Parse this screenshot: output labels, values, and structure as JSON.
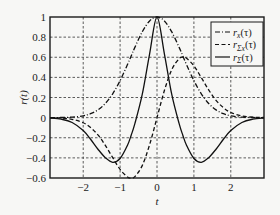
{
  "chart_data": {
    "type": "line",
    "title": "",
    "xlabel": "t",
    "ylabel": "r(t)",
    "xlim": [
      -2.9,
      2.9
    ],
    "ylim": [
      -0.6,
      1.0
    ],
    "xticks": [
      -2,
      -1,
      0,
      1,
      2
    ],
    "xtick_labels": [
      "−2",
      "−1",
      "0",
      "1",
      "2"
    ],
    "yticks": [
      -0.6,
      -0.4,
      -0.2,
      0,
      0.2,
      0.4,
      0.6,
      0.8,
      1
    ],
    "ytick_labels": [
      "−0.6",
      "−0.4",
      "−0.2",
      "0",
      "0.2",
      "0.4",
      "0.6",
      "0.8",
      "1"
    ],
    "grid": true,
    "grid_style": "dashed",
    "legend_position": "upper right",
    "x": [
      -2.9,
      -2.6,
      -2.3,
      -2.0,
      -1.8,
      -1.6,
      -1.4,
      -1.2,
      -1.0,
      -0.8,
      -0.7,
      -0.6,
      -0.4,
      -0.2,
      0.0,
      0.2,
      0.4,
      0.6,
      0.7,
      0.8,
      1.0,
      1.2,
      1.4,
      1.6,
      1.8,
      2.0,
      2.3,
      2.6,
      2.9
    ],
    "series": [
      {
        "name": "r_x(τ)",
        "legend_main": "r",
        "legend_sub": "x",
        "style": "dashdot",
        "values": [
          0.0002,
          0.0012,
          0.005,
          0.018,
          0.039,
          0.077,
          0.141,
          0.237,
          0.368,
          0.527,
          0.613,
          0.698,
          0.852,
          0.961,
          1.0,
          0.961,
          0.852,
          0.698,
          0.613,
          0.527,
          0.368,
          0.237,
          0.141,
          0.077,
          0.039,
          0.018,
          0.005,
          0.0012,
          0.0002
        ]
      },
      {
        "name": "r_Σx(τ)",
        "legend_main": "r",
        "legend_sub": "Σx",
        "style": "dashed",
        "values": [
          -0.001,
          -0.004,
          -0.017,
          -0.051,
          -0.099,
          -0.172,
          -0.276,
          -0.398,
          -0.515,
          -0.59,
          -0.601,
          -0.586,
          -0.477,
          -0.269,
          0.0,
          0.269,
          0.477,
          0.586,
          0.601,
          0.59,
          0.515,
          0.398,
          0.276,
          0.172,
          0.099,
          0.051,
          0.017,
          0.004,
          0.001
        ]
      },
      {
        "name": "r_Σ(τ)",
        "legend_main": "r",
        "legend_sub": "Σ",
        "style": "solid",
        "values": [
          -0.0038,
          -0.015,
          -0.048,
          -0.128,
          -0.215,
          -0.314,
          -0.398,
          -0.444,
          -0.406,
          -0.275,
          -0.175,
          -0.06,
          0.23,
          0.634,
          1.0,
          0.634,
          0.23,
          -0.06,
          -0.175,
          -0.275,
          -0.406,
          -0.444,
          -0.398,
          -0.314,
          -0.215,
          -0.128,
          -0.048,
          -0.015,
          -0.0038
        ]
      }
    ],
    "legend_paren": "(τ)"
  }
}
